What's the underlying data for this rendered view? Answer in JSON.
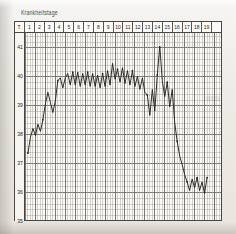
{
  "document": {
    "title": "Krankheitstage",
    "type": "fever-chart"
  },
  "header": {
    "first_label": "T.",
    "days": [
      "1",
      "2",
      "3",
      "4",
      "5",
      "6",
      "7",
      "8",
      "9",
      "10",
      "11",
      "12",
      "13",
      "14",
      "15",
      "16",
      "17",
      "18",
      "19"
    ]
  },
  "axis": {
    "labels": [
      "41",
      "40",
      "39",
      "38",
      "37",
      "36",
      "35"
    ]
  },
  "colors": {
    "ink": "#2b2926",
    "grid_major": "#6d6a64",
    "grid_minor": "#a9a59d",
    "paper": "#fbfaf7",
    "curve": "#262320"
  },
  "chart_data": {
    "type": "line",
    "title": "Krankheitstage",
    "xlabel": "Krankheitstage",
    "ylabel": "Temperatur (°C)",
    "ylim": [
      35,
      41.5
    ],
    "xlim": [
      0,
      19
    ],
    "grid": true,
    "legend": false,
    "yticks": [
      41,
      40,
      39,
      38,
      37,
      36,
      35
    ],
    "xticks": [
      "1",
      "2",
      "3",
      "4",
      "5",
      "6",
      "7",
      "8",
      "9",
      "10",
      "11",
      "12",
      "13",
      "14",
      "15",
      "16",
      "17",
      "18",
      "19"
    ],
    "series": [
      {
        "name": "Temperatur",
        "x": [
          0.3,
          0.55,
          0.8,
          1.05,
          1.3,
          1.55,
          1.8,
          2.05,
          2.3,
          2.55,
          2.8,
          3.05,
          3.3,
          3.55,
          3.8,
          4.05,
          4.3,
          4.55,
          4.8,
          5.05,
          5.3,
          5.55,
          5.8,
          6.05,
          6.3,
          6.55,
          6.8,
          7.05,
          7.3,
          7.55,
          7.8,
          8.05,
          8.3,
          8.55,
          8.8,
          9.05,
          9.3,
          9.55,
          9.8,
          10.05,
          10.3,
          10.55,
          10.8,
          11.05,
          11.3,
          11.55,
          11.8,
          12.05,
          12.3,
          12.55,
          12.8,
          13.05,
          13.3,
          13.55,
          13.8,
          14.05,
          14.3,
          14.55,
          14.8,
          15.05,
          15.3,
          15.55,
          15.8,
          16.05,
          16.3,
          16.55,
          16.8,
          17.05,
          17.3,
          17.55,
          17.8,
          18.05,
          18.3
        ],
        "values": [
          37.35,
          37.9,
          38.2,
          37.95,
          38.35,
          38.1,
          38.5,
          39.05,
          39.45,
          39.1,
          38.75,
          39.15,
          39.85,
          39.95,
          39.6,
          39.95,
          40.1,
          39.7,
          40.15,
          39.7,
          40.15,
          39.65,
          40.1,
          39.7,
          40.15,
          39.65,
          40.1,
          39.65,
          40.05,
          39.6,
          40.1,
          39.65,
          40.2,
          39.7,
          40.45,
          39.9,
          40.25,
          39.8,
          40.3,
          39.75,
          40.2,
          39.7,
          40.2,
          39.65,
          40.0,
          39.55,
          39.95,
          39.45,
          39.35,
          38.65,
          39.55,
          38.8,
          40.05,
          41.05,
          39.85,
          39.3,
          39.8,
          38.95,
          39.55,
          38.4,
          37.75,
          37.25,
          36.95,
          36.6,
          36.35,
          36.05,
          36.45,
          36.15,
          36.5,
          36.05,
          36.35,
          35.95,
          36.5
        ]
      }
    ]
  }
}
